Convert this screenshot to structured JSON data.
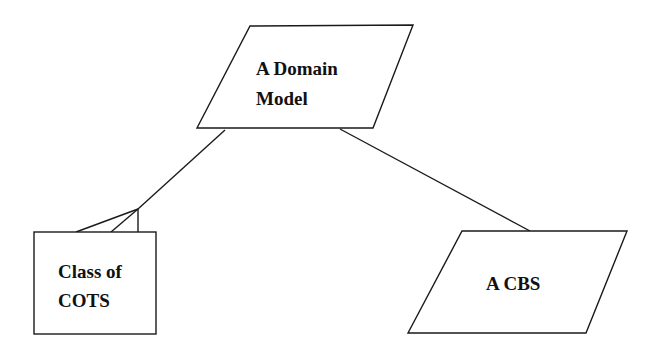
{
  "diagram": {
    "nodes": [
      {
        "id": "domain_model",
        "shape": "parallelogram",
        "lines": [
          "A Domain",
          "Model"
        ]
      },
      {
        "id": "class_of_cots",
        "shape": "rectangle",
        "lines": [
          "Class of",
          "COTS"
        ]
      },
      {
        "id": "cbs",
        "shape": "parallelogram",
        "lines": [
          "A CBS"
        ]
      }
    ],
    "edges": [
      {
        "from": "domain_model",
        "to": "class_of_cots",
        "style": "crows-foot"
      },
      {
        "from": "domain_model",
        "to": "cbs",
        "style": "plain"
      }
    ]
  }
}
